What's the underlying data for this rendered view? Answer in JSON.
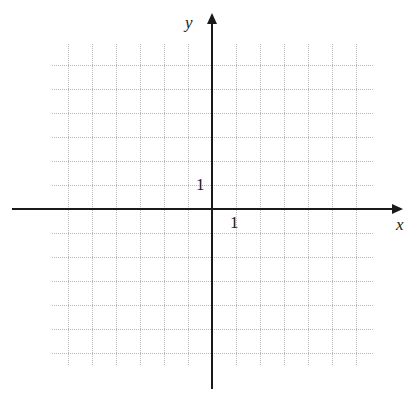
{
  "figure": {
    "kind": "cartesian-coordinate-grid",
    "width": 415,
    "height": 397,
    "background_color": "#ffffff"
  },
  "axes": {
    "x": {
      "label": "x",
      "tick_label": "1",
      "color": "#1a1a1a",
      "arrow": "right-arrow"
    },
    "y": {
      "label": "y",
      "tick_label": "1",
      "color": "#1a1a1a",
      "arrow": "up-arrow"
    }
  },
  "chart_data": {
    "type": "scatter",
    "title": "",
    "subtitle": "",
    "xlabel": "x",
    "ylabel": "y",
    "xlim": [
      -6.667,
      6.75
    ],
    "ylim": [
      -6.542,
      6.875
    ],
    "xticks": [
      1
    ],
    "xticklabels": [
      "1"
    ],
    "yticks": [
      1
    ],
    "yticklabels": [
      "1"
    ],
    "grid": true,
    "grid_style": "dotted",
    "grid_color": "#b9b9b9",
    "grid_spacing_units": 1,
    "legend": false,
    "legend_position": "none",
    "series": [],
    "annotations": []
  },
  "grid_geometry": {
    "origin_x_px": 212,
    "origin_y_px": 209,
    "cell_px": 24,
    "left_px": 52,
    "right_px": 374,
    "top_px": 44,
    "bottom_px": 366,
    "x_axis_start_px": 12,
    "x_axis_end_px": 392,
    "y_axis_top_px": 24,
    "y_axis_bottom_px": 389
  }
}
